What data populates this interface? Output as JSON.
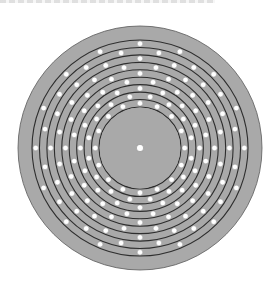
{
  "figure": {
    "type": "concentric-track-disk",
    "canvas": {
      "width": 280,
      "height": 288
    },
    "center": {
      "x": 140,
      "y": 148
    },
    "outer_disk": {
      "radius": 122,
      "fill": "#a9a9a9",
      "edge": "#5a5a5a"
    },
    "inner_hub": {
      "radius": 41,
      "fill": "#a9a9a9",
      "edge": "#2e2e2e"
    },
    "center_dot": {
      "radius": 3.6,
      "fill": "#ffffff"
    },
    "tracks": {
      "count": 9,
      "inner_radius": 41,
      "outer_radius": 108,
      "line_color": "#2e2e2e",
      "line_width": 1.1,
      "dots_per_track": 16,
      "stagger": "half-step alternating",
      "dot_radius": 2.7,
      "dot_fill": "#ffffff",
      "dot_edge": "#8a8a8a"
    },
    "top_strip": {
      "note": "clipped, illegible text remnants"
    }
  }
}
